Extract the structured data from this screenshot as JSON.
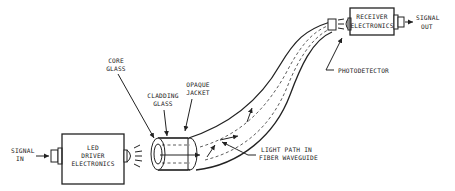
{
  "diagram": {
    "labels": {
      "signal_in": [
        "SIGNAL",
        "IN"
      ],
      "led_driver": [
        "LED",
        "DRIVER",
        "ELECTRONICS"
      ],
      "core_glass": [
        "CORE",
        "GLASS"
      ],
      "cladding_glass": [
        "CLADDING",
        "GLASS"
      ],
      "opaque_jacket": [
        "OPAQUE",
        "JACKET"
      ],
      "light_path": [
        "LIGHT PATH IN",
        "FIBER WAVEGUIDE"
      ],
      "photodetector": "PHOTODETECTOR",
      "receiver": [
        "RECEIVER",
        "ELECTRONICS"
      ],
      "signal_out": [
        "SIGNAL",
        "OUT"
      ]
    },
    "components": [
      {
        "id": "led-driver-electronics",
        "type": "box"
      },
      {
        "id": "led-emitter",
        "type": "lens"
      },
      {
        "id": "fiber-waveguide",
        "type": "cable",
        "layers": [
          "core glass",
          "cladding glass",
          "opaque jacket"
        ]
      },
      {
        "id": "photodetector",
        "type": "lens"
      },
      {
        "id": "receiver-electronics",
        "type": "box"
      }
    ],
    "flow": [
      "SIGNAL IN",
      "LED DRIVER ELECTRONICS",
      "FIBER WAVEGUIDE",
      "PHOTODETECTOR",
      "RECEIVER ELECTRONICS",
      "SIGNAL OUT"
    ]
  }
}
